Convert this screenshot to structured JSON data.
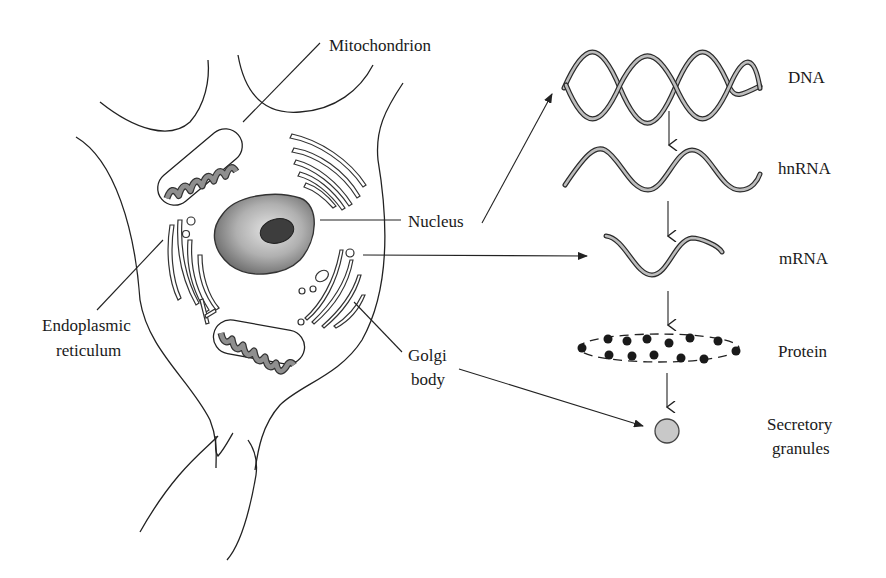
{
  "diagram": {
    "type": "biology-schematic",
    "colors": {
      "line": "#222222",
      "nucleus_light": "#d9d9d9",
      "nucleus_dark": "#6e6e6e",
      "nucleolus": "#3d3d3d",
      "mitochondria_fill": "#8a8a8a",
      "granule_fill": "#c8c8c8",
      "protein_bead": "#1a1a1a"
    }
  },
  "labels": {
    "mitochondrion": "Mitochondrion",
    "nucleus": "Nucleus",
    "endoplasmic_line1": "Endoplasmic",
    "endoplasmic_line2": "reticulum",
    "golgi_line1": "Golgi",
    "golgi_line2": "body"
  },
  "pathway": {
    "steps": [
      {
        "label": "DNA"
      },
      {
        "label": "hnRNA"
      },
      {
        "label": "mRNA"
      },
      {
        "label": "Protein"
      },
      {
        "label_line1": "Secretory",
        "label_line2": "granules"
      }
    ],
    "arrows": [
      {
        "from": "DNA",
        "to": "hnRNA"
      },
      {
        "from": "hnRNA",
        "to": "mRNA"
      },
      {
        "from": "mRNA",
        "to": "Protein"
      },
      {
        "from": "Protein",
        "to": "Secretory granules"
      },
      {
        "from": "Nucleus",
        "to": "DNA"
      },
      {
        "from": "Endoplasmic reticulum",
        "to": "mRNA"
      },
      {
        "from": "Golgi body",
        "to": "Secretory granules"
      }
    ]
  }
}
